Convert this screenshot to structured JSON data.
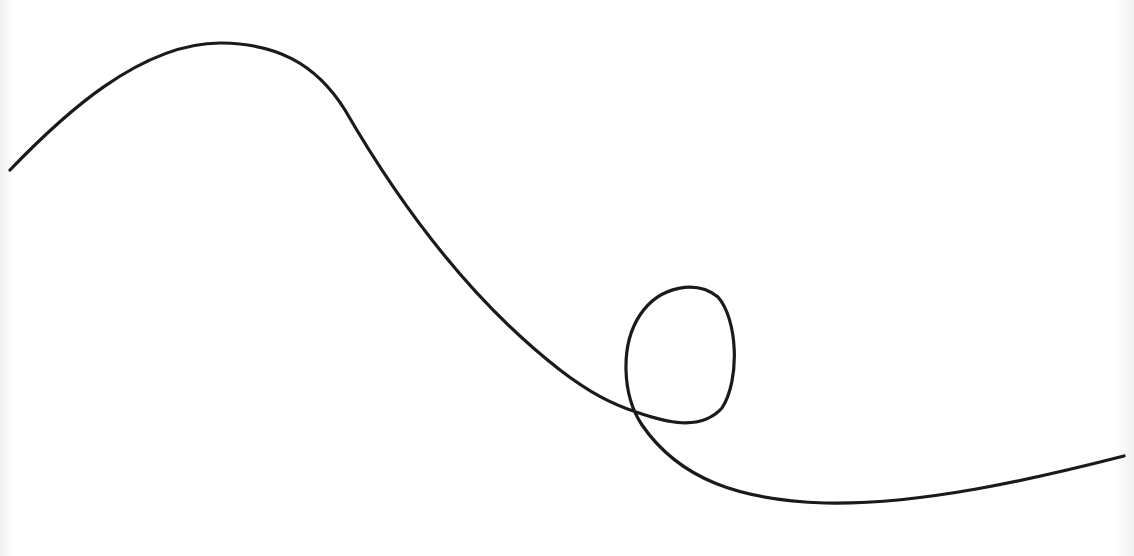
{
  "scene": {
    "description": "A single black hand-drawn curve on a white background: it rises from the left edge to a rounded peak, descends in a long slope, forms a closed loop, then continues toward the right edge",
    "background_color": "#ffffff",
    "stroke_color": "#1a1a1a",
    "stroke_width": 3.2,
    "curve_path": "M 10 170 C 60 118, 140 42, 222 43 C 275 44, 315 62, 345 110 C 400 205, 470 300, 560 370 C 590 393, 612 404, 636 412 C 665 422, 700 432, 722 408 C 740 380, 738 320, 718 297 C 697 280, 660 285, 640 315 C 620 345, 622 395, 642 425 C 680 480, 740 500, 825 503 C 920 505, 1030 480, 1124 456",
    "left_edge_shadow": true,
    "right_edge_shadow": true
  }
}
